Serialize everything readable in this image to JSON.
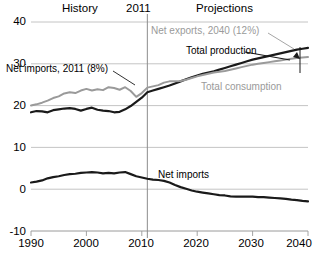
{
  "chart_data": {
    "type": "line",
    "title": "",
    "xlabel": "",
    "ylabel": "",
    "xlim": [
      1990,
      2040
    ],
    "ylim": [
      -10,
      40
    ],
    "grid": true,
    "legend_position": "inline-annotations",
    "xticks": [
      "1990",
      "2000",
      "2010",
      "2020",
      "2030",
      "2040"
    ],
    "yticks": [
      "-10",
      "0",
      "10",
      "20",
      "30",
      "40"
    ],
    "annotations": [
      {
        "name": "history-label",
        "text": "History",
        "color": "#000000"
      },
      {
        "name": "divider-year-label",
        "text": "2011",
        "color": "#000000"
      },
      {
        "name": "projections-label",
        "text": "Projections",
        "color": "#000000"
      },
      {
        "name": "net-exports-callout",
        "text": "Net exports, 2040 (12%)",
        "color": "#9a9a9a"
      },
      {
        "name": "total-production-label",
        "text": "Total production",
        "color": "#000000"
      },
      {
        "name": "net-imports-callout",
        "text": "Net imports, 2011 (8%)",
        "color": "#000000"
      },
      {
        "name": "total-consumption-label",
        "text": "Total consumption",
        "color": "#9a9a9a"
      },
      {
        "name": "net-imports-label",
        "text": "Net imports",
        "color": "#000000"
      }
    ],
    "divider_x": 2011,
    "colors": {
      "production": "#1a1a1a",
      "consumption": "#9a9a9a",
      "net_imports": "#1a1a1a",
      "grid": "#bdbdbd",
      "divider": "#8c8c8c"
    },
    "x": [
      1990,
      1991,
      1992,
      1993,
      1994,
      1995,
      1996,
      1997,
      1998,
      1999,
      2000,
      2001,
      2002,
      2003,
      2004,
      2005,
      2006,
      2007,
      2008,
      2009,
      2010,
      2011,
      2012,
      2013,
      2014,
      2015,
      2016,
      2017,
      2018,
      2019,
      2020,
      2021,
      2022,
      2023,
      2024,
      2025,
      2026,
      2027,
      2028,
      2029,
      2030,
      2031,
      2032,
      2033,
      2034,
      2035,
      2036,
      2037,
      2038,
      2039,
      2040
    ],
    "series": [
      {
        "name": "Total production",
        "color": "#1a1a1a",
        "values": [
          18.4,
          18.7,
          18.6,
          18.4,
          18.9,
          19.1,
          19.3,
          19.4,
          19.2,
          18.8,
          19.2,
          19.5,
          19.0,
          18.8,
          18.7,
          18.4,
          18.5,
          19.1,
          19.9,
          20.9,
          21.9,
          23.2,
          23.6,
          24.0,
          24.4,
          24.8,
          25.3,
          25.8,
          26.3,
          26.8,
          27.2,
          27.6,
          27.9,
          28.2,
          28.6,
          29.0,
          29.4,
          29.8,
          30.2,
          30.6,
          31.0,
          31.3,
          31.6,
          31.9,
          32.2,
          32.5,
          32.8,
          33.1,
          33.4,
          33.6,
          33.8
        ]
      },
      {
        "name": "Total consumption",
        "color": "#9a9a9a",
        "values": [
          20.0,
          20.3,
          20.7,
          21.2,
          21.8,
          22.2,
          22.9,
          23.2,
          23.0,
          23.6,
          24.0,
          23.6,
          23.9,
          23.7,
          24.4,
          24.2,
          23.8,
          24.4,
          23.5,
          22.1,
          23.0,
          24.3,
          24.6,
          24.9,
          25.5,
          25.8,
          25.8,
          25.9,
          26.2,
          26.6,
          27.0,
          27.3,
          27.6,
          27.9,
          28.1,
          28.3,
          28.6,
          28.9,
          29.2,
          29.5,
          29.8,
          30.0,
          30.2,
          30.4,
          30.6,
          30.8,
          31.0,
          31.2,
          31.4,
          31.5,
          31.6
        ]
      },
      {
        "name": "Net imports",
        "color": "#1a1a1a",
        "values": [
          1.6,
          1.8,
          2.1,
          2.6,
          2.9,
          3.1,
          3.4,
          3.6,
          3.7,
          3.9,
          4.0,
          4.1,
          4.0,
          3.8,
          3.9,
          3.8,
          4.0,
          4.1,
          3.6,
          3.1,
          2.8,
          2.5,
          2.3,
          2.2,
          2.0,
          1.6,
          1.0,
          0.5,
          0.1,
          -0.3,
          -0.6,
          -0.8,
          -1.0,
          -1.2,
          -1.4,
          -1.5,
          -1.7,
          -1.8,
          -1.8,
          -1.8,
          -1.8,
          -1.9,
          -1.9,
          -2.0,
          -2.1,
          -2.2,
          -2.3,
          -2.5,
          -2.6,
          -2.8,
          -2.9
        ]
      }
    ]
  }
}
